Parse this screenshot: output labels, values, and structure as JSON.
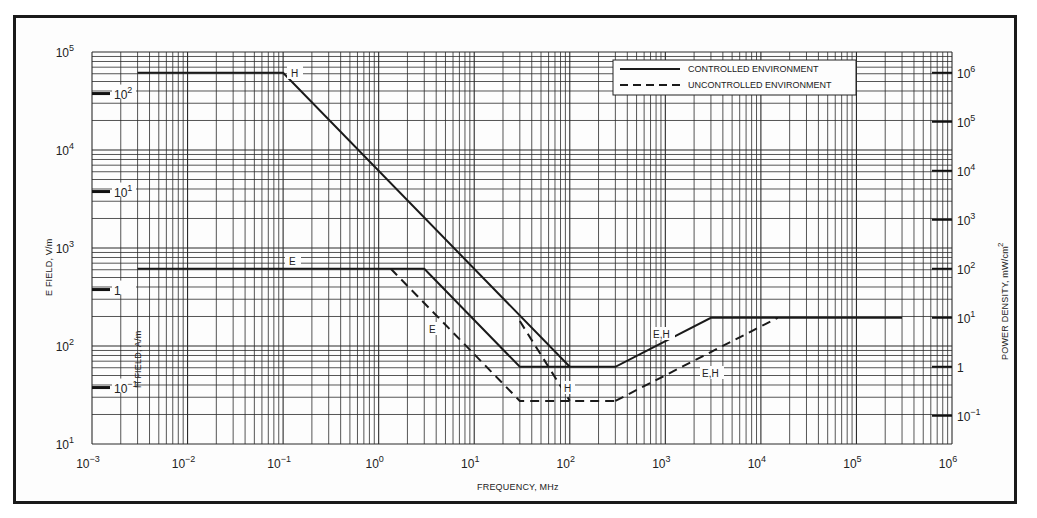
{
  "chart_data": {
    "type": "line",
    "title": "",
    "xlabel": "FREQUENCY, MHz",
    "ylabel": "E FIELD, V/m",
    "ylabel_secondary_left": "H FIELD, A/m",
    "ylabel_right": "POWER DENSITY, mW/cm²",
    "xscale": "log",
    "yscale": "log",
    "xlim": [
      0.001,
      1000000
    ],
    "ylim": [
      10,
      100000
    ],
    "grid": true,
    "x_tick_labels": [
      "10⁻³",
      "10⁻²",
      "10⁻¹",
      "10⁰",
      "10¹",
      "10²",
      "10³",
      "10⁴",
      "10⁵",
      "10⁶"
    ],
    "x_ticks": [
      0.001,
      0.01,
      0.1,
      1,
      10,
      100,
      1000,
      10000,
      100000,
      1000000
    ],
    "y_tick_labels": [
      "10⁵",
      "10⁴",
      "10³",
      "10²",
      "10¹"
    ],
    "y_ticks": [
      100000,
      10000,
      1000,
      100,
      10
    ],
    "h_field_tick_labels": [
      "10²",
      "10¹",
      "1",
      "10⁻¹"
    ],
    "h_field_ticks": [
      100,
      10,
      1,
      0.1
    ],
    "power_density_tick_labels": [
      "10⁶",
      "10⁵",
      "10⁴",
      "10³",
      "10²",
      "10¹",
      "1",
      "10⁻¹"
    ],
    "power_density_ticks": [
      1000000,
      100000,
      10000,
      1000,
      100,
      10,
      1,
      0.1
    ],
    "legend": {
      "position": "upper right",
      "entries": [
        {
          "label": "CONTROLLED ENVIRONMENT",
          "style": "solid"
        },
        {
          "label": "UNCONTROLLED ENVIRONMENT",
          "style": "dashed"
        }
      ]
    },
    "series": [
      {
        "name": "Controlled H",
        "style": "solid",
        "label": "H",
        "x": [
          0.003,
          0.1,
          100
        ],
        "y": [
          61400,
          61400,
          61.4
        ]
      },
      {
        "name": "Controlled E",
        "style": "solid",
        "label": "E",
        "x": [
          0.003,
          3,
          30,
          100
        ],
        "y": [
          614,
          614,
          61.4,
          61.4
        ]
      },
      {
        "name": "Controlled E,H",
        "style": "solid",
        "label": "E,H",
        "x": [
          100,
          300,
          3000,
          300000
        ],
        "y": [
          61.4,
          61.4,
          194,
          194
        ]
      },
      {
        "name": "Uncontrolled E",
        "style": "dashed",
        "label": "E",
        "x": [
          1.34,
          30,
          300
        ],
        "y": [
          614,
          27.5,
          27.5
        ]
      },
      {
        "name": "Uncontrolled H",
        "style": "dashed",
        "label": "H",
        "x": [
          30,
          100
        ],
        "y": [
          180,
          27.5
        ]
      },
      {
        "name": "Uncontrolled E,H",
        "style": "dashed",
        "label": "E,H",
        "x": [
          300,
          15000
        ],
        "y": [
          27.5,
          194
        ]
      }
    ],
    "annotations": [
      "H",
      "E",
      "E",
      "H",
      "E,H",
      "E,H"
    ]
  },
  "labels": {
    "x_axis": "FREQUENCY, MHz",
    "y_axis_left": "E FIELD, V/m",
    "y_axis_h": "H FIELD, A/m",
    "y_axis_right": "POWER DENSITY, mW/cm",
    "y_axis_right_sup": "2",
    "legend_controlled": "CONTROLLED ENVIRONMENT",
    "legend_uncontrolled": "UNCONTROLLED ENVIRONMENT",
    "curve_H": "H",
    "curve_E": "E",
    "curve_E_unc": "E",
    "curve_H_unc": "H",
    "curve_EH": "E,H",
    "curve_EH_unc": "E,H"
  },
  "colors": {
    "line": "#1a1a1a",
    "grid": "#2b2b2b",
    "background": "#fdfdfd"
  }
}
